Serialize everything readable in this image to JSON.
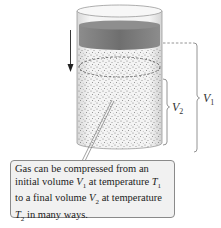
{
  "figure": {
    "labels": {
      "v1": {
        "symbol": "V",
        "subscript": "1"
      },
      "v2": {
        "symbol": "V",
        "subscript": "2"
      }
    },
    "callout": {
      "line1": "Gas can be compressed from an",
      "line2_pre": "initial volume ",
      "line2_v": "V",
      "line2_vsub": "1",
      "line2_mid": " at temperature ",
      "line2_t": "T",
      "line2_tsub": "1",
      "line3_pre": "to a final volume ",
      "line3_v": "V",
      "line3_vsub": "2",
      "line3_mid": " at temperature",
      "line4_t": "T",
      "line4_tsub": "2",
      "line4_post": " in many ways."
    },
    "colors": {
      "piston": "#7d7d7d",
      "cylinder_outline": "#9a9a9a",
      "gas_dots": "#6b6b6b",
      "bracket": "#7a7a7a",
      "callout_bg": "#f1f1f1",
      "callout_border": "#8a8a8a"
    }
  }
}
